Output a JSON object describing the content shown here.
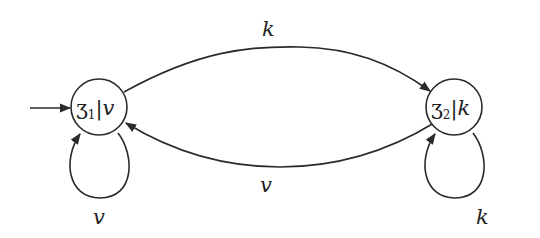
{
  "diagram": {
    "type": "state machine (Moore automaton)",
    "nodes": [
      {
        "id": "z1",
        "name": "ʒ",
        "subscript": "1",
        "output": "v",
        "initial": true
      },
      {
        "id": "z2",
        "name": "ʒ",
        "subscript": "2",
        "output": "k",
        "initial": false
      }
    ],
    "edges": [
      {
        "from": "z1",
        "to": "z2",
        "label": "k"
      },
      {
        "from": "z2",
        "to": "z1",
        "label": "v"
      },
      {
        "from": "z1",
        "to": "z1",
        "label": "v"
      },
      {
        "from": "z2",
        "to": "z2",
        "label": "k"
      }
    ],
    "separator": "|",
    "colors": {
      "stroke": "#2a2a2a",
      "text": "#1e1e1e",
      "background": "#ffffff"
    }
  }
}
